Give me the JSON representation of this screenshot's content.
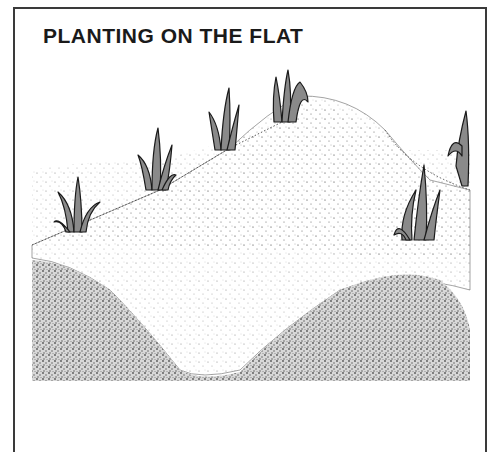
{
  "illustration": {
    "title": "PLANTING ON THE FLAT",
    "description": "Stippled pen illustration of leek plants planted on flat ground with a raised earth ridge and a sunken trench in the foreground",
    "colors": {
      "border": "#3a3a3a",
      "ink": "#1a1a1a",
      "leaf_fill": "#8a8a8a",
      "stipple_light": "#bdbdbd",
      "stipple_dark": "#6a6a6a"
    },
    "plants": [
      {
        "name": "plant-left-front",
        "x": 78,
        "y": 232
      },
      {
        "name": "plant-left-mid",
        "x": 156,
        "y": 188
      },
      {
        "name": "plant-center",
        "x": 225,
        "y": 148
      },
      {
        "name": "plant-top-ridge",
        "x": 286,
        "y": 120
      },
      {
        "name": "plant-right-front",
        "x": 420,
        "y": 238
      },
      {
        "name": "plant-right-edge",
        "x": 464,
        "y": 185
      }
    ]
  }
}
